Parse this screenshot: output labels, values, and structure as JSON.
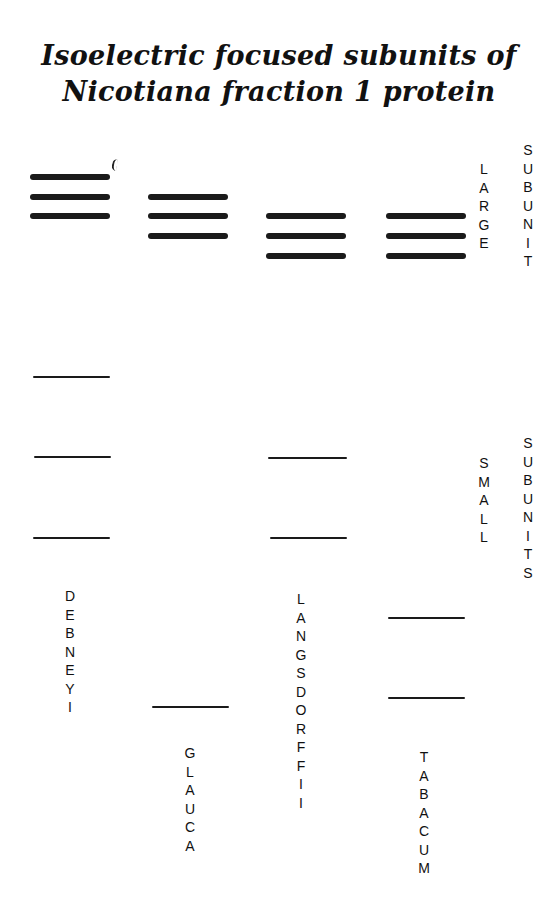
{
  "title": {
    "line1": "Isoelectric focused subunits of",
    "line2": "Nicotiana fraction 1 protein"
  },
  "side_labels": {
    "large": "LARGE",
    "subunit": "SUBUNIT",
    "small": "SMALL",
    "subunits": "SUBUNITS"
  },
  "lanes": [
    {
      "name": "DEBNEYI",
      "large_bands": 3,
      "small_bands": 3
    },
    {
      "name": "GLAUCA",
      "large_bands": 3,
      "small_bands": 1
    },
    {
      "name": "LANGSDORFFII",
      "large_bands": 3,
      "small_bands": 2
    },
    {
      "name": "TABACUM",
      "large_bands": 3,
      "small_bands": 2
    }
  ],
  "chart_data": {
    "type": "diagram",
    "title": "Isoelectric focused subunits of Nicotiana fraction 1 protein",
    "groups": [
      "Large subunit",
      "Small subunits"
    ],
    "lanes": [
      {
        "species": "debneyi",
        "large_band_y": [
          177,
          197,
          216
        ],
        "small_band_y": [
          377,
          457,
          538
        ]
      },
      {
        "species": "glauca",
        "large_band_y": [
          197,
          216,
          236
        ],
        "small_band_y": [
          707
        ]
      },
      {
        "species": "langsdorffii",
        "large_band_y": [
          216,
          236,
          256
        ],
        "small_band_y": [
          458,
          538
        ]
      },
      {
        "species": "tabacum",
        "large_band_y": [
          216,
          236,
          256
        ],
        "small_band_y": [
          618,
          698
        ]
      }
    ]
  }
}
